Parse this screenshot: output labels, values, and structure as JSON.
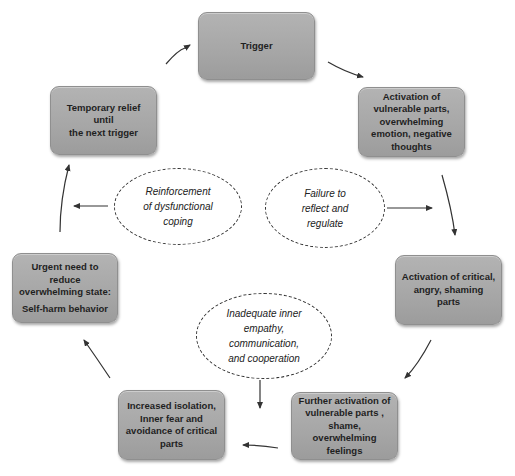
{
  "diagram": {
    "type": "cycle",
    "nodes": [
      {
        "id": "trigger",
        "label": "Trigger"
      },
      {
        "id": "activation-vulnerable",
        "label": "Activation of vulnerable parts, overwhelming emotion, negative thoughts"
      },
      {
        "id": "activation-critical",
        "label": "Activation of critical, angry, shaming parts"
      },
      {
        "id": "further-activation",
        "label": "Further activation of vulnerable parts , shame, overwhelming feelings"
      },
      {
        "id": "increased-isolation",
        "label": "Increased isolation, Inner fear  and avoidance of critical parts"
      },
      {
        "id": "urgent-need",
        "label": "Urgent need to reduce overwhelming state:",
        "sublabel": "Self-harm  behavior"
      },
      {
        "id": "temporary-relief",
        "label": "Temporary relief until the next trigger"
      }
    ],
    "mediators": [
      {
        "id": "reinforcement",
        "label": "Reinforcement of dysfunctional coping"
      },
      {
        "id": "failure",
        "label": "Failure to reflect and regulate"
      },
      {
        "id": "inadequate",
        "label": "Inadequate inner empathy, communication, and cooperation"
      }
    ],
    "edges": [
      {
        "from": "trigger",
        "to": "activation-vulnerable"
      },
      {
        "from": "activation-vulnerable",
        "to": "activation-critical"
      },
      {
        "from": "activation-critical",
        "to": "further-activation"
      },
      {
        "from": "further-activation",
        "to": "increased-isolation"
      },
      {
        "from": "increased-isolation",
        "to": "urgent-need"
      },
      {
        "from": "urgent-need",
        "to": "temporary-relief"
      },
      {
        "from": "temporary-relief",
        "to": "trigger"
      }
    ],
    "colors": {
      "box_fill": "#a6a6a6",
      "box_border": "#8f8f8f",
      "text": "#1f1f1f",
      "arrow": "#333333"
    }
  },
  "text": {
    "trigger": "Trigger",
    "activation_vulnerable": [
      "Activation of",
      "vulnerable parts,",
      "overwhelming",
      "emotion, negative",
      "thoughts"
    ],
    "activation_critical": [
      "Activation of critical,",
      "angry, shaming parts"
    ],
    "further_activation": [
      "Further activation of",
      "vulnerable parts ,",
      "shame, overwhelming",
      "feelings"
    ],
    "increased_isolation": [
      "Increased isolation,",
      "Inner fear  and",
      "avoidance of critical",
      "parts"
    ],
    "urgent_need": [
      "Urgent need to reduce",
      "overwhelming state:",
      "Self-harm  behavior"
    ],
    "temporary_relief": [
      "Temporary relief until",
      "the next trigger"
    ],
    "reinforcement": [
      "Reinforcement",
      "of dysfunctional",
      "coping"
    ],
    "failure": [
      "Failure to",
      "reflect and",
      "regulate"
    ],
    "inadequate": [
      "Inadequate inner",
      "empathy,",
      "communication,",
      "and cooperation"
    ]
  }
}
